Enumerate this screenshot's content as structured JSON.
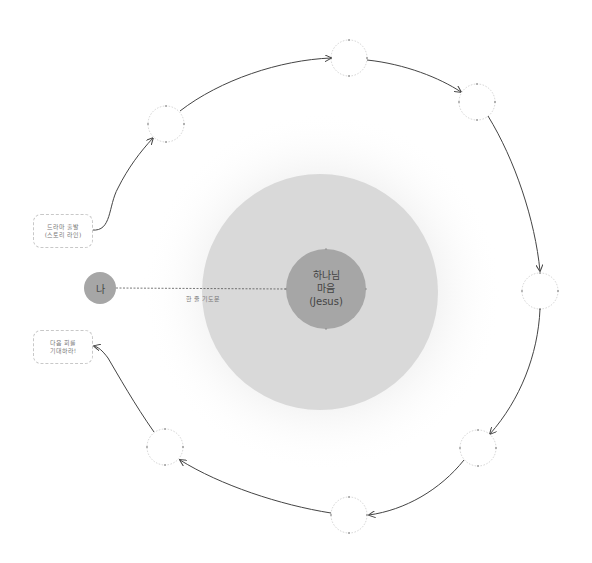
{
  "diagram": {
    "center": {
      "line1": "하나님",
      "line2": "마음",
      "line3": "(Jesus)"
    },
    "me": {
      "label": "나"
    },
    "connector": {
      "label": "한 줄 기도문"
    },
    "start_box": {
      "line1": "드라마 출발",
      "line2": "(스토리 라인)"
    },
    "end_box": {
      "line1": "다음 회를",
      "line2": "기대하라!"
    },
    "cycle_nodes": [
      {
        "id": "node-top-left",
        "label": ""
      },
      {
        "id": "node-top",
        "label": ""
      },
      {
        "id": "node-top-right",
        "label": ""
      },
      {
        "id": "node-right",
        "label": ""
      },
      {
        "id": "node-bottom-right",
        "label": ""
      },
      {
        "id": "node-bottom",
        "label": ""
      },
      {
        "id": "node-bottom-left",
        "label": ""
      }
    ],
    "colors": {
      "halo": "#f4f4f4",
      "ring": "#d9d9d9",
      "core": "#a6a6a6",
      "me": "#a6a6a6",
      "arrow": "#444444",
      "node_border": "#c8c8c8"
    }
  }
}
